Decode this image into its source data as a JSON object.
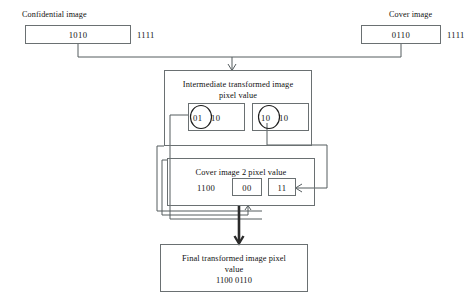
{
  "diagram": {
    "colors": {
      "stroke": "#6a7072",
      "wire": "#555c5f",
      "wire_emphasis": "#2b2b2b",
      "text": "#111111",
      "background": "#ffffff"
    },
    "nodes": {
      "confidential": {
        "caption": "Confidential image",
        "boxed_value": "1010",
        "trailing_value": "1111"
      },
      "cover": {
        "caption": "Cover image",
        "boxed_value": "0110",
        "trailing_value": "1111"
      },
      "intermediate": {
        "title_line1": "Intermediate transformed image",
        "title_line2": "pixel value",
        "left_cell": {
          "circled": "01",
          "rest": "10"
        },
        "right_cell": {
          "circled": "10",
          "rest": "10"
        }
      },
      "cover2": {
        "title": "Cover image 2 pixel value",
        "plain_value": "1100",
        "boxed_value_1": "00",
        "boxed_value_2": "11"
      },
      "final": {
        "title_line1": "Final transformed image pixel",
        "title_line2": "value",
        "value": "1100 0110"
      }
    },
    "connectors": [
      {
        "name": "confidential-to-merge",
        "kind": "elbow"
      },
      {
        "name": "cover-to-merge",
        "kind": "elbow"
      },
      {
        "name": "merge-to-intermediate",
        "kind": "arrow-down"
      },
      {
        "name": "intermediate-left-to-final",
        "kind": "elbow-left"
      },
      {
        "name": "intermediate-right-to-cover2",
        "kind": "elbow-right-arrow"
      },
      {
        "name": "cover2-to-final",
        "kind": "arrow-down-thick"
      },
      {
        "name": "feedback-to-cover2",
        "kind": "arrow-up"
      }
    ]
  }
}
